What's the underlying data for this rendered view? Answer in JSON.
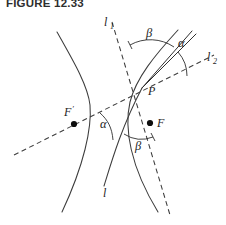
{
  "figure": {
    "caption": "FIGURE 12.33",
    "type": "geometry-diagram",
    "background_color": "#ffffff",
    "ink_color": "#3c3c3c"
  },
  "labels": {
    "line_l1": "l",
    "line_l1_sub": "1",
    "line_l2": "l",
    "line_l2_sub": "2",
    "line_l": "l",
    "point_p": "P",
    "focus_right": "F",
    "focus_left": "F",
    "focus_left_prime": "′",
    "angle_alpha_top": "α",
    "angle_beta_top": "β",
    "angle_alpha_bottom": "α",
    "angle_beta_bottom": "β"
  },
  "points": {
    "P": {
      "x": 142,
      "y": 88
    },
    "F": {
      "x": 150,
      "y": 123
    },
    "F_prime": {
      "x": 74,
      "y": 124
    }
  },
  "geometry": {
    "left_branch": "M 57,32 C 74,62 88,86 90,105 C 92,128 84,165 62,212",
    "right_branch": "M 178,30 C 155,55 136,78 130,102 C 124,128 130,166 158,212",
    "tangent_l": "M 104,186 C 112,160 122,126 142,88",
    "l1_dashed": "M 112,22 L 170,215",
    "l2_dashed": "M 14,155 L 214,55",
    "ray_to_F": "M 142,88 L 192,31",
    "ray_parallel": "M 142,88 L 196,34"
  },
  "arcs": {
    "beta_top": "M 130,45 A 42,42 0 0 1 174,47",
    "alpha_top": "M 178,52 A 36,36 0 0 1 187,76",
    "alpha_bot": "M 100,113 C 108,120 112,128 113,140",
    "beta_bot": "M 124,134 A 32,32 0 0 0 153,137"
  },
  "ticks": {
    "beta_top_left": "M 128,41 L 132,49",
    "beta_bot_right": "M 151,133 L 155,141"
  }
}
